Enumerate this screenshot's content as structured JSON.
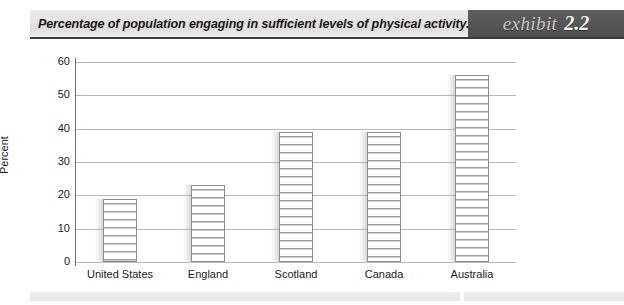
{
  "header": {
    "title": "Percentage of population engaging in sufficient levels of physical activity.",
    "badge_word": "exhibit",
    "badge_number": "2.2",
    "badge_bg": "#565656",
    "band_bg": "#e4e2e2"
  },
  "chart_data": {
    "type": "bar",
    "title": "Percentage of population engaging in sufficient levels of physical activity.",
    "categories": [
      "United States",
      "England",
      "Scotland",
      "Canada",
      "Australia"
    ],
    "values": [
      19,
      23,
      39,
      39,
      56
    ],
    "xlabel": "",
    "ylabel": "Percent",
    "ylim": [
      0,
      60
    ],
    "ytick_labels": [
      "0",
      "10",
      "20",
      "30",
      "40",
      "50",
      "60"
    ],
    "ytick_values": [
      0,
      10,
      20,
      30,
      40,
      50,
      60
    ],
    "grid": true,
    "legend": false,
    "bar_fill": "horizontal-stripe-hatch",
    "bar_fill_colors": [
      "#ffffff",
      "#9d9d9d"
    ],
    "axis_color": "#6d6d6d",
    "gridline_color": "#b9b9b9"
  }
}
